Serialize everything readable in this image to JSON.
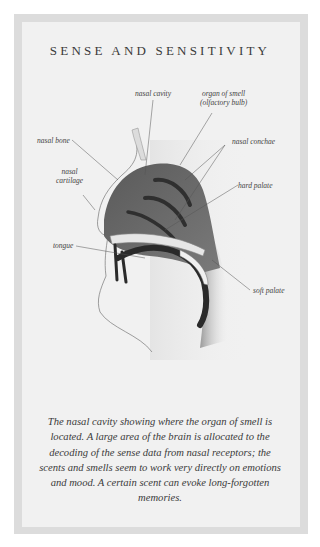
{
  "title": "SENSE AND SENSITIVITY",
  "labels": {
    "nasal_cavity": "nasal cavity",
    "organ_of_smell_line1": "organ of smell",
    "organ_of_smell_line2": "(olfactory bulb)",
    "nasal_bone": "nasal bone",
    "nasal_conchae": "nasal conchae",
    "nasal_cartilage_line1": "nasal",
    "nasal_cartilage_line2": "cartilage",
    "hard_palate": "hard palate",
    "tongue": "tongue",
    "soft_palate": "soft palate"
  },
  "caption": "The nasal cavity showing where the organ of smell is located. A large area of the brain is allocated to the decoding of the sense data from nasal receptors; the scents and smells seem to work very directly on emotions and mood. A certain scent can evoke long-forgotten memories."
}
